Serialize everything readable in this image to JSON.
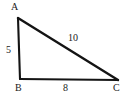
{
  "figure": {
    "kind": "labeled-triangle-diagram",
    "width": 133,
    "height": 104,
    "background_color": "#ffffff",
    "stroke_color": "#141414",
    "text_color": "#1a1a1a"
  },
  "vertices": [
    {
      "id": "A",
      "label": "A",
      "x": 18,
      "y": 18,
      "position": "top-left-apex"
    },
    {
      "id": "B",
      "label": "B",
      "x": 20,
      "y": 79,
      "position": "bottom-left"
    },
    {
      "id": "C",
      "label": "C",
      "x": 118,
      "y": 80,
      "position": "bottom-right"
    }
  ],
  "sides": [
    {
      "id": "AB",
      "from": "A",
      "to": "B",
      "label": "5",
      "role": "left-leg"
    },
    {
      "id": "AC",
      "from": "A",
      "to": "C",
      "label": "10",
      "role": "hypotenuse"
    },
    {
      "id": "BC",
      "from": "B",
      "to": "C",
      "label": "8",
      "role": "base"
    }
  ]
}
